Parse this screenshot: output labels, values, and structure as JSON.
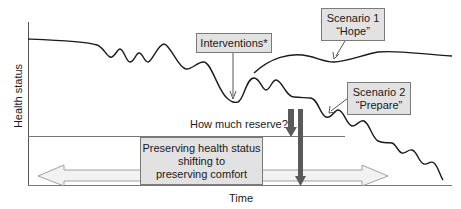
{
  "axes": {
    "y_label": "Health status",
    "x_label": "Time"
  },
  "boxes": {
    "interventions": "Interventions*",
    "scenario1": {
      "line1": "Scenario 1",
      "line2": "“Hope”"
    },
    "scenario2": {
      "line1": "Scenario 2",
      "line2": "“Prepare”"
    },
    "center": {
      "line1": "Preserving health status",
      "line2": "shifting to",
      "line3": "preserving comfort"
    }
  },
  "annotations": {
    "reserve_question": "How much reserve?"
  },
  "colors": {
    "box_fill": "#e2e2e2",
    "box_border": "#7a7a7a",
    "curve": "#1a1a1a",
    "dark_arrow": "#5a5a5a",
    "double_arrow_fill": "#f0f0f0",
    "axis": "#555555"
  }
}
